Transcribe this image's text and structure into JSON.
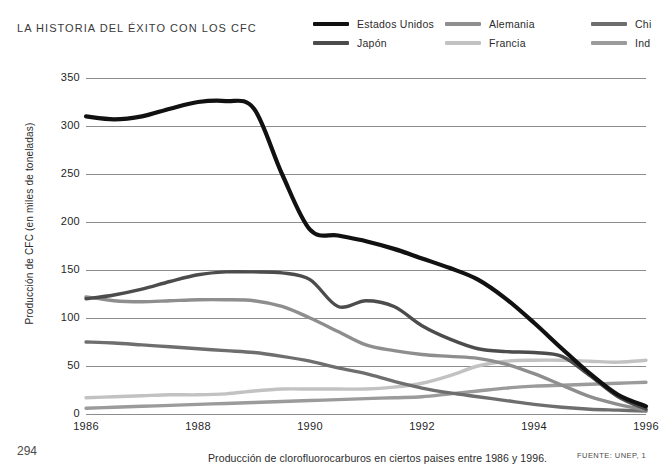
{
  "header": {
    "title": "LA HISTORIA DEL ÉXITO CON LOS CFC"
  },
  "footer": {
    "page_number": "294",
    "caption": "Producción de clorofluorocarburos en ciertos paises entre 1986 y 1996.",
    "source": "FUENTE: UNEP, 1"
  },
  "chart_data": {
    "type": "line",
    "title": "LA HISTORIA DEL ÉXITO CON LOS CFC",
    "subtitle": "Producción de clorofluorocarburos en ciertos paises entre 1986 y 1996.",
    "xlabel": "",
    "ylabel": "Producción de CFC (en miles de toneladas)",
    "xlim": [
      1986,
      1996
    ],
    "ylim": [
      0,
      350
    ],
    "yticks": [
      0,
      50,
      100,
      150,
      200,
      250,
      300,
      350
    ],
    "ytick_labels": [
      "0",
      "50",
      "100",
      "150",
      "200",
      "250",
      "300",
      "350"
    ],
    "xticks": [
      1986,
      1988,
      1990,
      1992,
      1994,
      1996
    ],
    "xtick_labels": [
      "1986",
      "1988",
      "1990",
      "1992",
      "1994",
      "1996"
    ],
    "grid": "horizontal",
    "legend_position": "top-right",
    "x": [
      1986,
      1986.5,
      1987,
      1987.5,
      1988,
      1988.5,
      1989,
      1989.5,
      1990,
      1990.5,
      1991,
      1991.5,
      1992,
      1992.5,
      1993,
      1993.5,
      1994,
      1994.5,
      1995,
      1995.5,
      1996
    ],
    "series": [
      {
        "name": "Estados Unidos",
        "color": "#111111",
        "width": 4.2,
        "values": [
          310,
          307,
          310,
          318,
          325,
          326,
          318,
          250,
          192,
          186,
          180,
          172,
          162,
          152,
          140,
          120,
          95,
          68,
          42,
          20,
          8
        ]
      },
      {
        "name": "Japón",
        "color": "#4c4c4c",
        "width": 3.4,
        "values": [
          120,
          124,
          130,
          138,
          145,
          148,
          148,
          147,
          140,
          112,
          118,
          112,
          92,
          78,
          68,
          65,
          64,
          60,
          40,
          18,
          5
        ]
      },
      {
        "name": "Alemania",
        "color": "#8e8e8e",
        "width": 3.4,
        "values": [
          122,
          118,
          117,
          118,
          119,
          119,
          118,
          112,
          100,
          86,
          72,
          66,
          62,
          60,
          58,
          52,
          42,
          30,
          18,
          10,
          4
        ]
      },
      {
        "name": "Francia",
        "color": "#c2c2c2",
        "width": 3.4,
        "values": [
          17,
          18,
          19,
          20,
          20,
          21,
          24,
          26,
          26,
          26,
          26,
          28,
          32,
          40,
          50,
          55,
          56,
          56,
          55,
          54,
          56
        ]
      },
      {
        "name": "China",
        "color": "#6e6e6e",
        "width": 3.4,
        "values": [
          75,
          74,
          72,
          70,
          68,
          66,
          64,
          60,
          55,
          48,
          42,
          34,
          27,
          22,
          18,
          14,
          10,
          7,
          5,
          4,
          3
        ]
      },
      {
        "name": "India",
        "color": "#9b9b9b",
        "width": 3.4,
        "values": [
          6,
          7,
          8,
          9,
          10,
          11,
          12,
          13,
          14,
          15,
          16,
          17,
          18,
          21,
          24,
          27,
          29,
          30,
          31,
          32,
          33
        ]
      }
    ],
    "legend": [
      {
        "label": "Estados Unidos",
        "color": "#111111",
        "truncated": false
      },
      {
        "label": "Japón",
        "color": "#4c4c4c",
        "truncated": false
      },
      {
        "label": "Alemania",
        "color": "#8e8e8e",
        "truncated": false
      },
      {
        "label": "Francia",
        "color": "#c2c2c2",
        "truncated": false
      },
      {
        "label": "Chi",
        "color": "#6e6e6e",
        "truncated": true
      },
      {
        "label": "Ind",
        "color": "#9b9b9b",
        "truncated": true
      }
    ]
  }
}
